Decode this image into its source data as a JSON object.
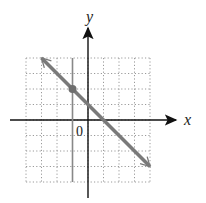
{
  "chart_data": {
    "type": "line",
    "title": "",
    "xlabel": "x",
    "ylabel": "y",
    "origin_label": "0",
    "xlim": [
      -4,
      4
    ],
    "ylim": [
      -4,
      4
    ],
    "grid": true,
    "grid_style": "dotted",
    "series": [
      {
        "name": "line",
        "equation": "y = -x + 1",
        "x": [
          -3,
          4
        ],
        "y": [
          4,
          -3
        ],
        "color": "#7a7a7a",
        "arrows": "both"
      },
      {
        "name": "vertical-line",
        "equation": "x = -1",
        "x": [
          -1,
          -1
        ],
        "y": [
          4,
          -4
        ],
        "color": "#888888"
      }
    ],
    "points": [
      {
        "x": -1,
        "y": 2,
        "label": ""
      }
    ]
  }
}
